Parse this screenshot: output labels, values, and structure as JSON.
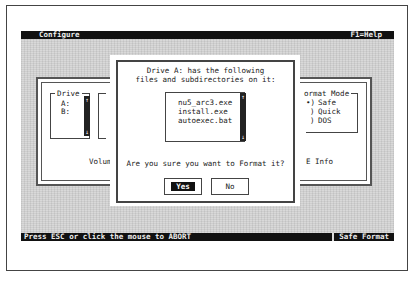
{
  "window": {
    "title": "Configure",
    "help_hint": "F1=Help"
  },
  "background_panel": {
    "drive_group": {
      "label": "Drive",
      "items": [
        "A:",
        "B:"
      ]
    },
    "volume_label": "Volum",
    "format_mode_group": {
      "label": "ormat Mode",
      "options": [
        {
          "marker": "•)",
          "label": "Safe",
          "selected": true
        },
        {
          "marker": ")",
          "label": "Quick",
          "selected": false
        },
        {
          "marker": ")",
          "label": "DOS",
          "selected": false
        }
      ]
    },
    "info_label": "E Info"
  },
  "dialog": {
    "message_line1": "Drive A: has the following",
    "message_line2": "files and subdirectories on it:",
    "files": [
      "nu5_arc3.exe",
      "install.exe",
      "autoexec.bat"
    ],
    "question": "Are you sure you want to Format it?",
    "yes_label": "Yes",
    "no_label": "No"
  },
  "status_bar": {
    "message": "Press ESC or click the mouse to ABORT",
    "mode": "Safe Format"
  },
  "icons": {
    "scroll_up": "↑",
    "scroll_down": "↓"
  }
}
